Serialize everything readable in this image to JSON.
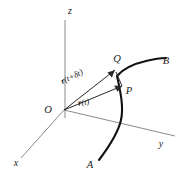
{
  "figure": {
    "background_color": "#ffffff",
    "axis_color": "#8b8b8b",
    "curve_color": "#111111",
    "vector_color": "#2a2a2a",
    "axes": [
      {
        "id": "z",
        "label": "z",
        "label_x": 70,
        "label_y": 14
      },
      {
        "id": "y",
        "label": "y",
        "label_x": 161,
        "label_y": 147
      },
      {
        "id": "x",
        "label": "x",
        "label_x": 16,
        "label_y": 166
      }
    ],
    "points": [
      {
        "id": "origin",
        "label": "O",
        "label_x": 48,
        "label_y": 113
      },
      {
        "id": "curve-start",
        "label": "A",
        "label_x": 90,
        "label_y": 168
      },
      {
        "id": "curve-end",
        "label": "B",
        "label_x": 166,
        "label_y": 64
      },
      {
        "id": "point-p",
        "label": "P",
        "label_x": 129,
        "label_y": 94
      },
      {
        "id": "point-q",
        "label": "Q",
        "label_x": 117,
        "label_y": 62
      }
    ],
    "vectors": [
      {
        "id": "r-t",
        "name": "r",
        "argument": "(t)",
        "label_x": 84,
        "label_y": 105,
        "rotation": -8,
        "from": "O",
        "to": "P"
      },
      {
        "id": "r-t-plus-delta-t",
        "name": "r",
        "argument": "(t+δt)",
        "label_x": 73,
        "label_y": 79,
        "rotation": -26,
        "from": "O",
        "to": "Q"
      }
    ],
    "curve": {
      "id": "space-curve",
      "from_label": "A",
      "to_label": "B",
      "through": [
        "P",
        "Q"
      ]
    }
  }
}
